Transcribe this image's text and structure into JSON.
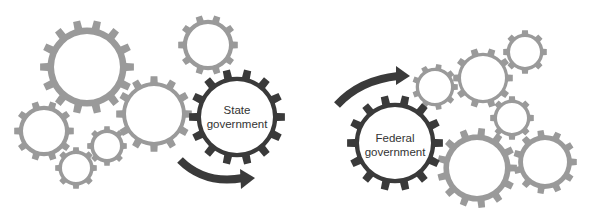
{
  "colors": {
    "light_gear": "#9a9a9a",
    "dark_gear": "#3a3a3a",
    "arrow": "#3a3a3a",
    "background": "#ffffff"
  },
  "left_group": {
    "highlight": {
      "line1": "State",
      "line2": "government"
    },
    "gears": [
      {
        "cx": 87,
        "cy": 67,
        "r": 47,
        "hole": 33,
        "teeth": 14
      },
      {
        "cx": 208,
        "cy": 45,
        "r": 30,
        "hole": 21,
        "teeth": 10
      },
      {
        "cx": 154,
        "cy": 114,
        "r": 38,
        "hole": 28,
        "teeth": 12
      },
      {
        "cx": 44,
        "cy": 131,
        "r": 30,
        "hole": 21,
        "teeth": 10
      },
      {
        "cx": 107,
        "cy": 146,
        "r": 20,
        "hole": 13,
        "teeth": 8
      },
      {
        "cx": 76,
        "cy": 168,
        "r": 21,
        "hole": 14,
        "teeth": 8
      }
    ],
    "dark_gear": {
      "cx": 237,
      "cy": 117,
      "r": 48,
      "hole": 36,
      "teeth": 14
    }
  },
  "right_group": {
    "highlight": {
      "line1": "Federal",
      "line2": "government"
    },
    "gears": [
      {
        "cx": 435,
        "cy": 87,
        "r": 23,
        "hole": 16,
        "teeth": 9
      },
      {
        "cx": 483,
        "cy": 78,
        "r": 30,
        "hole": 22,
        "teeth": 10
      },
      {
        "cx": 525,
        "cy": 52,
        "r": 22,
        "hole": 15,
        "teeth": 8
      },
      {
        "cx": 512,
        "cy": 118,
        "r": 22,
        "hole": 15,
        "teeth": 8
      },
      {
        "cx": 477,
        "cy": 168,
        "r": 40,
        "hole": 28,
        "teeth": 13
      },
      {
        "cx": 545,
        "cy": 162,
        "r": 32,
        "hole": 22,
        "teeth": 11
      }
    ],
    "dark_gear": {
      "cx": 395,
      "cy": 143,
      "r": 48,
      "hole": 36,
      "teeth": 14
    }
  }
}
